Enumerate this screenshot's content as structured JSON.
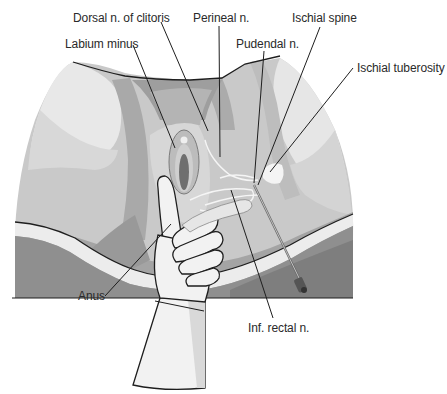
{
  "figure": {
    "colors": {
      "background": "#ffffff",
      "skin_light": "#e6e6e6",
      "skin_mid": "#cfcfcf",
      "skin_shade": "#b5b5b5",
      "skin_dark": "#9c9c9c",
      "drape": "#8e8e8e",
      "drape_dark": "#777777",
      "outline": "#1e1e1e",
      "glove": "#f2f2f2",
      "glove_shade": "#d9d9d9"
    }
  },
  "labels": {
    "dorsal_n_clitoris": "Dorsal n. of clitoris",
    "labium_minus": "Labium minus",
    "perineal_n": "Perineal n.",
    "pudendal_n": "Pudendal n.",
    "ischial_spine": "Ischial spine",
    "ischial_tuberosity": "Ischial tuberosity",
    "anus": "Anus",
    "inf_rectal_n": "Inf. rectal n."
  }
}
